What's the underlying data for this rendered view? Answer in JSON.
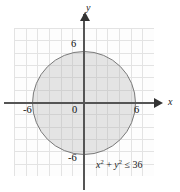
{
  "figure": {
    "name": "circle-inequality-graph",
    "axes": {
      "x_label": "x",
      "y_label": "y",
      "origin_label": "0",
      "x_ticks": [
        "-6",
        "6"
      ],
      "y_ticks": [
        "6",
        "-6"
      ]
    },
    "annotation": {
      "var_x": "x",
      "exp_x": "2",
      "plus": " + ",
      "var_y": "y",
      "exp_y": "2",
      "relation": " ≤ ",
      "value": "36",
      "full_text": "x² + y² ≤ 36"
    },
    "colors": {
      "region_fill": "#b4b4b4",
      "region_stroke": "#7a7a7a",
      "axis": "#555555",
      "grid": "#e3e3e3",
      "background": "#ffffff"
    }
  },
  "chart_data": {
    "type": "scatter",
    "title": "",
    "xlabel": "x",
    "ylabel": "y",
    "xlim": [
      -8,
      8
    ],
    "ylim": [
      -8,
      8
    ],
    "grid": true,
    "legend": "none",
    "xticks": [
      -6,
      6
    ],
    "yticks": [
      -6,
      6
    ],
    "xticklabels": [
      "-6",
      "6"
    ],
    "yticklabels": [
      "6",
      "-6"
    ],
    "origin_label": "0",
    "annotations": [
      "x² + y² ≤ 36"
    ],
    "series": [
      {
        "name": "x^2 + y^2 <= 36",
        "kind": "filled-disk",
        "center": [
          0,
          0
        ],
        "radius": 6,
        "boundary": "solid",
        "inclusive": true,
        "fill": "#b4b4b4",
        "stroke": "#7a7a7a"
      }
    ]
  }
}
